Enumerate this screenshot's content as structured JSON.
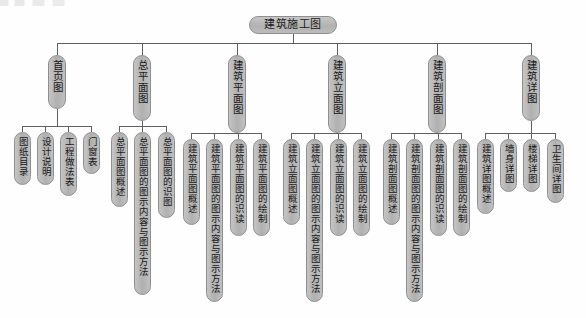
{
  "diagram": {
    "type": "tree",
    "orientation": "top-down",
    "root": {
      "label": "建筑施工图"
    },
    "colors": {
      "node_fill": "#b9b9b9",
      "node_border": "#8f8f8f",
      "connector": "#5f5f5f",
      "background": "#ffffff",
      "text": "#1a1a1a"
    },
    "branches": [
      {
        "label": "首页图",
        "children": [
          {
            "label": "图纸目录"
          },
          {
            "label": "设计说明"
          },
          {
            "label": "工程做法表"
          },
          {
            "label": "门窗表"
          }
        ]
      },
      {
        "label": "总平面图",
        "children": [
          {
            "label": "总平面图概述"
          },
          {
            "label": "总平面图的图示内容与图示方法"
          },
          {
            "label": "总平面图的识图"
          }
        ]
      },
      {
        "label": "建筑平面图",
        "children": [
          {
            "label": "建筑平面图概述"
          },
          {
            "label": "建筑平面图的图示内容与图示方法"
          },
          {
            "label": "建筑平面图的识读"
          },
          {
            "label": "建筑平面图的绘制"
          }
        ]
      },
      {
        "label": "建筑立面图",
        "children": [
          {
            "label": "建筑立面图概述"
          },
          {
            "label": "建筑立面图的图示内容与图示方法"
          },
          {
            "label": "建筑立面图的识读"
          },
          {
            "label": "建筑立面图的绘制"
          }
        ]
      },
      {
        "label": "建筑剖面图",
        "children": [
          {
            "label": "建筑剖面图概述"
          },
          {
            "label": "建筑剖面图的图示内容与图示方法"
          },
          {
            "label": "建筑剖面图的识读"
          },
          {
            "label": "建筑剖面图的绘制"
          }
        ]
      },
      {
        "label": "建筑详图",
        "children": [
          {
            "label": "建筑详图概述"
          },
          {
            "label": "墙身详图"
          },
          {
            "label": "楼梯详图"
          },
          {
            "label": "卫生间详图"
          }
        ]
      }
    ]
  }
}
